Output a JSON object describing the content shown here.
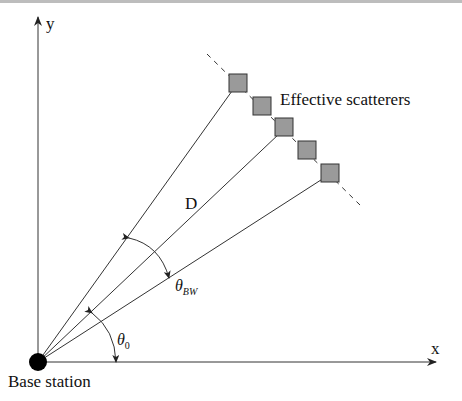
{
  "diagram": {
    "axes": {
      "x_label": "x",
      "y_label": "y"
    },
    "labels": {
      "scatterers": "Effective scatterers",
      "distance": "D",
      "beamwidth": "θBW",
      "beamwidth_base": "θ",
      "beamwidth_sub": "BW",
      "elevation": "θ0",
      "elevation_base": "θ",
      "elevation_sub": "0",
      "base_station": "Base station"
    },
    "nodes": [
      {
        "id": "base-station",
        "shape": "filled-circle",
        "color": "#000000"
      },
      {
        "id": "scatterer-1",
        "shape": "square",
        "color": "#9a9a9a"
      },
      {
        "id": "scatterer-2",
        "shape": "square",
        "color": "#9a9a9a"
      },
      {
        "id": "scatterer-3",
        "shape": "square",
        "color": "#9a9a9a"
      },
      {
        "id": "scatterer-4",
        "shape": "square",
        "color": "#9a9a9a"
      },
      {
        "id": "scatterer-5",
        "shape": "square",
        "color": "#9a9a9a"
      }
    ],
    "edges": [
      {
        "from": "base-station",
        "to": "scatterer-1",
        "style": "solid"
      },
      {
        "from": "base-station",
        "to": "scatterer-3",
        "style": "solid"
      },
      {
        "from": "base-station",
        "to": "scatterer-5",
        "style": "solid"
      }
    ]
  }
}
